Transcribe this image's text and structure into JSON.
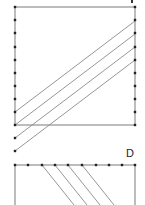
{
  "panels": [
    {
      "id": "C",
      "label": "",
      "label_visible": "cut-off",
      "box": {
        "x1": 15,
        "y1": 7,
        "x2": 135,
        "y2": 125
      },
      "left_dots_y": [
        7,
        20,
        33,
        47,
        60,
        73,
        86,
        99,
        112,
        125,
        138,
        151
      ],
      "right_dots_y": [
        7,
        20,
        33,
        47,
        60,
        73,
        86,
        99,
        112,
        125
      ],
      "hatch_lines": [
        {
          "x1": 15,
          "y1": 112,
          "x2": 135,
          "y2": 21
        },
        {
          "x1": 15,
          "y1": 125,
          "x2": 135,
          "y2": 34
        },
        {
          "x1": 15,
          "y1": 138,
          "x2": 135,
          "y2": 47
        },
        {
          "x1": 15,
          "y1": 151,
          "x2": 135,
          "y2": 60
        }
      ]
    },
    {
      "id": "D",
      "label": "D",
      "box": {
        "x1": 15,
        "y1": 165,
        "x2": 135,
        "y2": 205
      },
      "top_dots_x": [
        15,
        28,
        42,
        55,
        68,
        82,
        96,
        109,
        122,
        135
      ],
      "hatch_lines": [
        {
          "x1": 42,
          "y1": 165,
          "x2": 74,
          "y2": 205
        },
        {
          "x1": 55,
          "y1": 165,
          "x2": 87,
          "y2": 205
        },
        {
          "x1": 68,
          "y1": 165,
          "x2": 100,
          "y2": 205
        },
        {
          "x1": 82,
          "y1": 165,
          "x2": 114,
          "y2": 205
        }
      ]
    }
  ],
  "colors": {
    "frame": "#7a7a7a",
    "hatch": "#8a8a8a",
    "dot": "#222222",
    "label": "#222222",
    "background": "#ffffff"
  }
}
